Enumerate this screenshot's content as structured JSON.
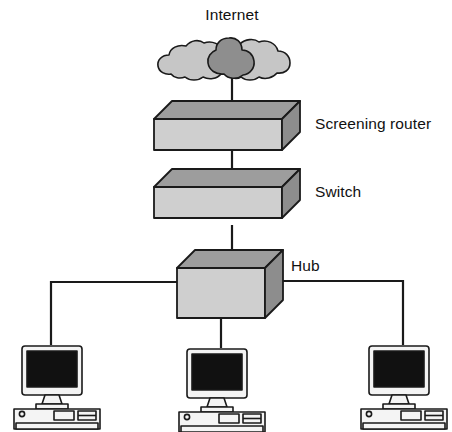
{
  "diagram": {
    "type": "network-topology",
    "background_color": "#ffffff",
    "line_color": "#1a1a1a",
    "labels": {
      "internet": "Internet",
      "screening_router": "Screening router",
      "switch": "Switch",
      "hub": "Hub"
    },
    "nodes": [
      {
        "id": "internet",
        "kind": "cloud",
        "label": "Internet",
        "fill": "#c6c6c6",
        "accent_fill": "#8e8e8e",
        "stroke": "#1a1a1a"
      },
      {
        "id": "screening-router",
        "kind": "slab-box",
        "label": "Screening router",
        "top_fill": "#9d9d9d",
        "front_fill": "#cfcfcf",
        "side_fill": "#8d8d8d",
        "stroke": "#1a1a1a"
      },
      {
        "id": "switch",
        "kind": "slab-box",
        "label": "Switch",
        "top_fill": "#9d9d9d",
        "front_fill": "#cfcfcf",
        "side_fill": "#8d8d8d",
        "stroke": "#1a1a1a"
      },
      {
        "id": "hub",
        "kind": "cube-box",
        "label": "Hub",
        "top_fill": "#9d9d9d",
        "front_fill": "#cfcfcf",
        "side_fill": "#8d8d8d",
        "stroke": "#1a1a1a"
      },
      {
        "id": "workstation-1",
        "kind": "desktop-computer",
        "label": "",
        "case_fill": "#f2f2f2",
        "screen_fill": "#111111",
        "stroke": "#1a1a1a"
      },
      {
        "id": "workstation-2",
        "kind": "desktop-computer",
        "label": "",
        "case_fill": "#f2f2f2",
        "screen_fill": "#111111",
        "stroke": "#1a1a1a"
      },
      {
        "id": "workstation-3",
        "kind": "desktop-computer",
        "label": "",
        "case_fill": "#f2f2f2",
        "screen_fill": "#111111",
        "stroke": "#1a1a1a"
      }
    ],
    "connections": [
      {
        "id": "link-internet-router",
        "from": "internet",
        "to": "screening-router",
        "style": "straight-vertical"
      },
      {
        "id": "link-router-switch",
        "from": "screening-router",
        "to": "switch",
        "style": "straight-vertical"
      },
      {
        "id": "link-switch-hub",
        "from": "switch",
        "to": "hub",
        "style": "straight-vertical"
      },
      {
        "id": "link-hub-workstation-1",
        "from": "hub",
        "to": "workstation-1",
        "style": "elbow-left"
      },
      {
        "id": "link-hub-workstation-2",
        "from": "hub",
        "to": "workstation-2",
        "style": "straight-vertical"
      },
      {
        "id": "link-hub-workstation-3",
        "from": "hub",
        "to": "workstation-3",
        "style": "elbow-right"
      }
    ]
  }
}
